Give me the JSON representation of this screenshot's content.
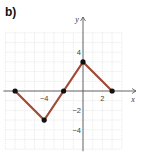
{
  "panel_label": "b)",
  "chart_data": {
    "type": "line",
    "title": "",
    "xlabel": "x",
    "ylabel": "y",
    "xlim": [
      -8,
      4
    ],
    "ylim": [
      -6,
      6
    ],
    "grid": true,
    "x_tick_labels": [
      {
        "value": -4,
        "label": "−4"
      },
      {
        "value": 2,
        "label": "2"
      }
    ],
    "y_tick_labels": [
      {
        "value": 4,
        "label": "4"
      },
      {
        "value": -2,
        "label": "−2"
      },
      {
        "value": -4,
        "label": "−4"
      }
    ],
    "series": [
      {
        "name": "piecewise",
        "color": "#9e4a35",
        "points": [
          [
            -7,
            0
          ],
          [
            -4,
            -3
          ],
          [
            -2,
            0
          ],
          [
            0,
            3
          ],
          [
            3,
            0
          ]
        ]
      }
    ],
    "marker_color": "#111111"
  }
}
